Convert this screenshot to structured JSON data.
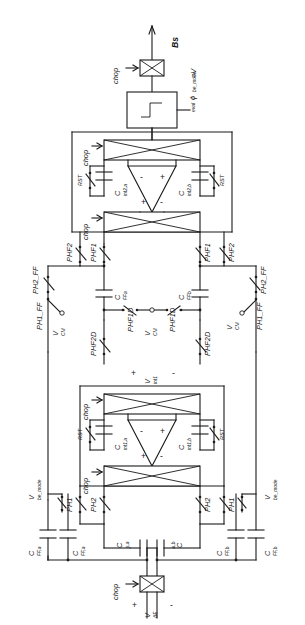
{
  "figure": {
    "orientation": "rotated-90",
    "type": "circuit-schematic"
  },
  "output_stage": {
    "bitstream_label": "Bs",
    "bitstream_note": "=V",
    "bitstream_note_sub": "be_mode",
    "chopper_label": "chop",
    "comparator_clock": "ϕ",
    "comparator_clock_sub": "eval",
    "comparator_symbol": "step"
  },
  "integrator2": {
    "chop_in_label": "chop",
    "chop_out_label": "chop",
    "cap_a": "C",
    "cap_a_sub": "int2,a",
    "cap_b": "C",
    "cap_b_sub": "int2,b",
    "reset_a": "RST",
    "reset_b": "RST",
    "opamp_in_minus": "-",
    "opamp_in_plus": "+",
    "opamp_out_plus": "+",
    "opamp_out_minus": "-"
  },
  "integrator1": {
    "chop_in_label": "chop",
    "chop_out_label": "chop",
    "cap_a": "C",
    "cap_a_sub": "int1,a",
    "cap_b": "C",
    "cap_b_sub": "int1,b",
    "reset_a": "RST",
    "reset_b": "RST",
    "node_plus": "+",
    "node_label": "V",
    "node_label_sub": "int1",
    "node_minus": "-"
  },
  "feedforward": {
    "cap_a": "C",
    "cap_a_sub": "FFa",
    "cap_b": "C",
    "cap_b_sub": "FFb",
    "switches_left": [
      "PHF2",
      "PHF1"
    ],
    "switches_right": [
      "PHF1",
      "PHF2"
    ],
    "ph2_ff_left": "PH2_FF",
    "ph1_ff_left": "PH1_FF",
    "ph2_ff_right": "PH2_FF",
    "ph1_ff_right": "PH1_FF",
    "vcm_left": "V",
    "vcm_left_sub": "CM",
    "vcm_right": "V",
    "vcm_right_sub": "CM",
    "vcm_center": "V",
    "vcm_center_sub": "CM",
    "phf1d_left": "PHF1D",
    "phf1d_right": "PHF1D",
    "phf2d_left": "PHF2D",
    "phf2d_right": "PHF2D"
  },
  "input_stage": {
    "cap_s_a": "C",
    "cap_s_a_sub": "s,a",
    "cap_s_b": "C",
    "cap_s_b_sub": "s,b",
    "cap_ff_a1": "C",
    "cap_ff_a1_sub": "FF,a",
    "cap_ff_a2": "C",
    "cap_ff_a2_sub": "FF,a",
    "cap_ff_b1": "C",
    "cap_ff_b1_sub": "FF,b",
    "cap_ff_b2": "C",
    "cap_ff_b2_sub": "FF,b",
    "vbe_left": "V",
    "vbe_left_sub": "be_mode",
    "vbe_right": "V",
    "vbe_right_sub": "be_mode",
    "ph1_left": "PH1",
    "ph2_left": "PH2",
    "ph2_right": "PH2",
    "ph1_right": "PH1",
    "chopper_label": "chop",
    "input_plus": "+",
    "input_label": "V",
    "input_label_sub": "ΔE",
    "input_minus": "-"
  },
  "colors": {
    "line": "#1a1a1a",
    "background": "#ffffff"
  }
}
